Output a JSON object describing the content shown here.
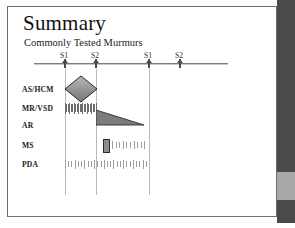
{
  "slide": {
    "title": "Summary",
    "subtitle": "Commonly Tested Murmurs"
  },
  "chart_data": {
    "type": "timeline",
    "title": "Summary",
    "subtitle": "Commonly Tested Murmurs",
    "xlabel": "",
    "ylabel": "",
    "grid": true,
    "legend_position": "none",
    "axis_ticks": [
      {
        "label": "S1",
        "x_px": 57,
        "gridline": true
      },
      {
        "label": "S2",
        "x_px": 88,
        "gridline": true
      },
      {
        "label": "S1",
        "x_px": 141,
        "gridline": true
      },
      {
        "label": "S2",
        "x_px": 172,
        "gridline": false
      }
    ],
    "categories": [
      "AS/HCM",
      "MR/VSD",
      "AR",
      "MS",
      "PDA"
    ],
    "series": [
      {
        "name": "AS/HCM",
        "shape": "diamond",
        "description": "crescendo-decrescendo systolic murmur",
        "start_tick": "S1",
        "end_tick": "S2",
        "x_start_px": 57,
        "x_end_px": 89,
        "peak_height_px": 14
      },
      {
        "name": "MR/VSD",
        "shape": "hatch",
        "description": "holosystolic uniform murmur",
        "start_tick": "S1",
        "end_tick": "S2",
        "x_start_px": 57,
        "x_end_px": 89,
        "height_px": 11,
        "bar_count": 22,
        "intensity": "dark"
      },
      {
        "name": "AR",
        "shape": "decrescendo-triangle",
        "description": "early diastolic decrescendo murmur",
        "start_tick": "S2",
        "end_tick": "S1",
        "x_start_px": 88,
        "x_end_px": 136,
        "height_px": 15
      },
      {
        "name": "MS",
        "shape": "opening-snap-plus-hatch",
        "description": "opening snap then mid-diastolic rumble",
        "start_tick": "S2",
        "end_tick": "S1",
        "snap_x_px": 95,
        "snap_width_px": 5,
        "snap_height_px": 12,
        "hatch_x_start_px": 104,
        "hatch_x_end_px": 140,
        "hatch_height_px": 8,
        "bar_count": 10,
        "intensity": "light"
      },
      {
        "name": "PDA",
        "shape": "hatch",
        "description": "continuous machine-like murmur",
        "start_tick": "S1",
        "end_tick": "S1",
        "x_start_px": 57,
        "x_end_px": 141,
        "height_px": 9,
        "bar_count": 26,
        "intensity": "light"
      }
    ],
    "row_y_px": [
      82,
      101,
      118,
      138,
      157
    ]
  },
  "rows": [
    {
      "label": "AS/HCM"
    },
    {
      "label": "MR/VSD"
    },
    {
      "label": "AR"
    },
    {
      "label": "MS"
    },
    {
      "label": "PDA"
    }
  ],
  "ticks": [
    {
      "label": "S1"
    },
    {
      "label": "S2"
    },
    {
      "label": "S1"
    },
    {
      "label": "S2"
    }
  ],
  "scrollbar": {
    "track_color": "#4a4a4a",
    "thumb_color": "#a8a8a8",
    "thumb_top_px": 172,
    "thumb_height_px": 28
  },
  "colors": {
    "page_background": "#ffffff",
    "page_border": "#6e6e6e",
    "axis": "#7d7d7d",
    "gridline": "#b9b9b9",
    "mark_dark": "#6d6d6d",
    "mark_light": "#9e9e9e",
    "shape_fill": "#8d8d8d",
    "shape_stroke": "#2a2a2a",
    "text": "#111111"
  }
}
